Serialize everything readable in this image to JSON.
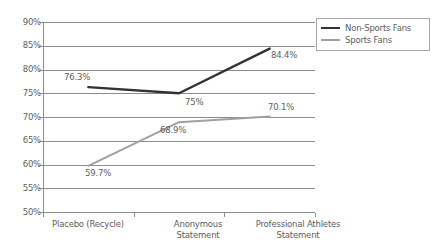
{
  "chart_data": {
    "type": "line",
    "title": "",
    "subtitle": "",
    "xlabel": "",
    "ylabel": "",
    "categories": [
      "Placebo (Recycle)",
      "Anonymous Statement",
      "Professional Athletes Statement"
    ],
    "category_lines": [
      [
        "Placebo (Recycle)"
      ],
      [
        "Anonymous",
        "Statement"
      ],
      [
        "Professional Athletes",
        "Statement"
      ]
    ],
    "series": [
      {
        "name": "Non-Sports Fans",
        "color": "#333333",
        "values": [
          76.3,
          75.0,
          84.4
        ],
        "labels": [
          "76.3%",
          "75%",
          "84.4%"
        ]
      },
      {
        "name": "Sports Fans",
        "color": "#a0a0a0",
        "values": [
          59.7,
          68.9,
          70.1
        ],
        "labels": [
          "59.7%",
          "68.9%",
          "70.1%"
        ]
      }
    ],
    "ylim": [
      50,
      90
    ],
    "ytick_step": 5,
    "ytick_labels": [
      "90%",
      "85%",
      "80%",
      "75%",
      "70%",
      "65%",
      "60%",
      "55%",
      "50%"
    ],
    "ytick_values": [
      90,
      85,
      80,
      75,
      70,
      65,
      60,
      55,
      50
    ],
    "grid": true,
    "grid_axis": "y",
    "legend_position": "top-right",
    "axis_color": "#8c8c8c",
    "text_color": "#5e5e5e",
    "background": "#ffffff"
  },
  "legend": {
    "entries": [
      {
        "label": "Non-Sports Fans",
        "color": "#333333"
      },
      {
        "label": "Sports Fans",
        "color": "#a0a0a0"
      }
    ]
  },
  "ytick_labels": {
    "t0": "90%",
    "t1": "85%",
    "t2": "80%",
    "t3": "75%",
    "t4": "70%",
    "t5": "65%",
    "t6": "60%",
    "t7": "55%",
    "t8": "50%"
  },
  "xtick_labels": {
    "c0l0": "Placebo (Recycle)",
    "c1l0": "Anonymous",
    "c1l1": "Statement",
    "c2l0": "Professional Athletes",
    "c2l1": "Statement"
  },
  "data_labels": {
    "ns0": "76.3%",
    "ns1": "75%",
    "ns2": "84.4%",
    "sf0": "59.7%",
    "sf1": "68.9%",
    "sf2": "70.1%"
  }
}
